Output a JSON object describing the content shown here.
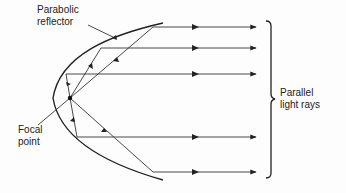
{
  "labels": {
    "reflector_line1": "Parabolic",
    "reflector_line2": "reflector",
    "focal_line1": "Focal",
    "focal_line2": "point",
    "rays_line1": "Parallel",
    "rays_line2": "light rays"
  },
  "colors": {
    "stroke": "#222222",
    "background": "#fdfdfd"
  },
  "diagram": {
    "focal_point": [
      70,
      98
    ],
    "parallel_ray_count": 5,
    "ray_y_positions": [
      27,
      48,
      74,
      137,
      172
    ]
  }
}
